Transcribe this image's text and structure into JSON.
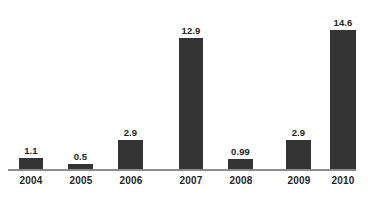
{
  "chart_data": {
    "type": "bar",
    "title": "",
    "subtitle": "",
    "xlabel": "",
    "ylabel": "",
    "categories": [
      "2004",
      "2005",
      "2006",
      "2007",
      "2008",
      "2009",
      "2010"
    ],
    "values": [
      1.1,
      0.5,
      2.9,
      12.9,
      0.99,
      2.9,
      14.6
    ],
    "value_labels": [
      "1.1",
      "0.5",
      "2.9",
      "12.9",
      "0.99",
      "2.9",
      "14.6"
    ],
    "ylim": [
      0,
      14.6
    ],
    "grid": false,
    "legend": null,
    "legend_position": "none",
    "annotations": [],
    "bar_color": "#343434",
    "axis_color": "#8c8c8c",
    "background_color": "#ffffff",
    "label_color": "#262626"
  },
  "bars": [
    {
      "category": "2004",
      "value": 1.1,
      "label": "1.1",
      "left": 19,
      "width": 24
    },
    {
      "category": "2005",
      "value": 0.5,
      "label": "0.5",
      "left": 68,
      "width": 25
    },
    {
      "category": "2006",
      "value": 2.9,
      "label": "2.9",
      "left": 118,
      "width": 25
    },
    {
      "category": "2007",
      "value": 12.9,
      "label": "12.9",
      "left": 179,
      "width": 24
    },
    {
      "category": "2008",
      "value": 0.99,
      "label": "0.99",
      "left": 228,
      "width": 25
    },
    {
      "category": "2009",
      "value": 2.9,
      "label": "2.9",
      "left": 286,
      "width": 25
    },
    {
      "category": "2010",
      "value": 14.6,
      "label": "14.6",
      "left": 330,
      "width": 26
    }
  ],
  "ticks": [
    {
      "label": "2004",
      "center": 31
    },
    {
      "label": "2005",
      "center": 81
    },
    {
      "label": "2006",
      "center": 131
    },
    {
      "label": "2007",
      "center": 191
    },
    {
      "label": "2008",
      "center": 241
    },
    {
      "label": "2009",
      "center": 299
    },
    {
      "label": "2010",
      "center": 343
    }
  ]
}
